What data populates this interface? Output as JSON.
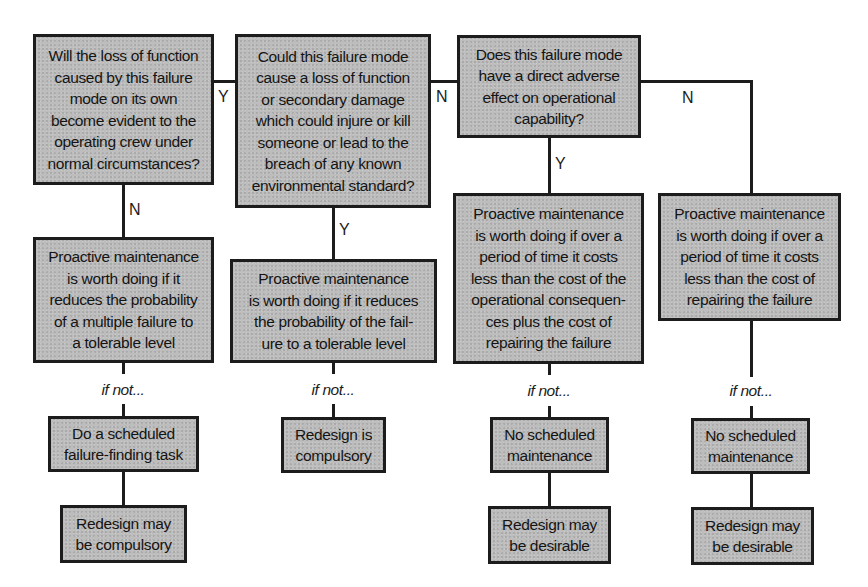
{
  "diagram": {
    "type": "decision-flowchart",
    "questions": [
      {
        "id": "q1",
        "text": "Will the loss of function\ncaused by this failure\nmode on its own\nbecome evident to the\noperating crew under\nnormal circumstances?"
      },
      {
        "id": "q2",
        "text": "Could this failure mode\ncause a loss of function\nor secondary damage\nwhich could injure or kill\nsomeone or lead to the\nbreach of any known\nenvironmental standard?"
      },
      {
        "id": "q3",
        "text": "Does this failure mode\nhave a direct adverse\neffect on operational\ncapability?"
      }
    ],
    "proactive": [
      {
        "id": "p1",
        "text": "Proactive maintenance\nis worth doing if it\nreduces the probability\nof a multiple failure to\na tolerable level"
      },
      {
        "id": "p2",
        "text": "Proactive maintenance\nis worth doing if it reduces\nthe probability of the fail-\nure to a tolerable level"
      },
      {
        "id": "p3",
        "text": "Proactive maintenance\nis worth doing if over a\nperiod of time it costs\nless than the cost of the\noperational consequen-\nces plus the cost of\nrepairing the failure"
      },
      {
        "id": "p4",
        "text": "Proactive maintenance\nis worth doing if over a\nperiod of time it costs\nless than the cost of\nrepairing the failure"
      }
    ],
    "if_not_label": "if not...",
    "default_actions": [
      {
        "id": "d1",
        "text": "Do a scheduled\nfailure-finding task"
      },
      {
        "id": "d2",
        "text": "Redesign is\ncompulsory"
      },
      {
        "id": "d3",
        "text": "No scheduled\nmaintenance"
      },
      {
        "id": "d4",
        "text": "No scheduled\nmaintenance"
      }
    ],
    "final_actions": [
      {
        "id": "f1",
        "text": "Redesign may\nbe compulsory"
      },
      {
        "id": "f3",
        "text": "Redesign may\nbe desirable"
      },
      {
        "id": "f4",
        "text": "Redesign may\nbe desirable"
      }
    ],
    "edge_labels": {
      "q1_to_q2": "Y",
      "q1_to_p1": "N",
      "q2_to_q3": "N",
      "q2_to_p2": "Y",
      "q3_to_p3": "Y",
      "q3_to_p4": "N"
    }
  }
}
